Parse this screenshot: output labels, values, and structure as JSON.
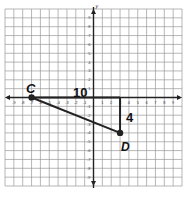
{
  "graph": {
    "x_axis_label": "x",
    "y_axis_label": "y",
    "x_range": [
      -10,
      10
    ],
    "y_range": [
      -10,
      10
    ],
    "tick_labels_x": [
      "-9",
      "-8",
      "-7",
      "-6",
      "-5",
      "-4",
      "-3",
      "-2",
      "-1",
      "1",
      "2",
      "3",
      "4",
      "5",
      "6",
      "7",
      "8",
      "9"
    ],
    "tick_labels_y": [
      "9",
      "8",
      "7",
      "6",
      "5",
      "4",
      "3",
      "2",
      "1",
      "-1",
      "-2",
      "-3",
      "-4",
      "-5",
      "-6",
      "-7",
      "-8",
      "-9"
    ]
  },
  "points": [
    {
      "name": "C",
      "x": -7,
      "y": 0
    },
    {
      "name": "D",
      "x": 3,
      "y": -4
    }
  ],
  "annotations": {
    "horizontal_length": "10",
    "vertical_length": "4"
  },
  "colors": {
    "grid": "#9a9a9a",
    "axis": "#222222",
    "figure": "#222222"
  }
}
